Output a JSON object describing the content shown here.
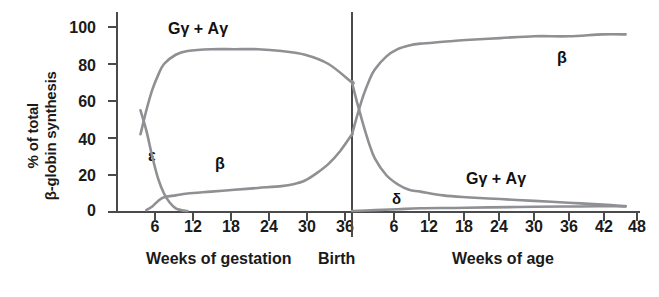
{
  "chart_data": {
    "type": "line",
    "title": "",
    "ylabel": "% of total\nβ-globin synthesis",
    "ylim": [
      0,
      100
    ],
    "yticks": [
      0,
      20,
      40,
      60,
      80,
      100
    ],
    "grid": false,
    "legend_position": "inline-annotations",
    "panels": [
      {
        "name": "gestation",
        "xlabel": "Weeks of gestation",
        "xticks": [
          6,
          12,
          18,
          24,
          30,
          36
        ],
        "xlim": [
          0,
          40
        ]
      },
      {
        "name": "postnatal",
        "xlabel": "Weeks of age",
        "xticks": [
          6,
          12,
          18,
          24,
          30,
          36,
          42,
          48
        ],
        "xlim": [
          0,
          50
        ]
      }
    ],
    "divider_label": "Birth",
    "annotations": [
      {
        "text": "Gγ + Aγ",
        "series": "gamma",
        "panel": "gestation",
        "position": "top-left"
      },
      {
        "text": "ε",
        "series": "epsilon",
        "panel": "gestation",
        "position": "left"
      },
      {
        "text": "β",
        "series": "beta",
        "panel": "gestation",
        "position": "mid-low"
      },
      {
        "text": "β",
        "series": "beta",
        "panel": "postnatal",
        "position": "top-right"
      },
      {
        "text": "Gγ + Aγ",
        "series": "gamma",
        "panel": "postnatal",
        "position": "bottom-right"
      },
      {
        "text": "δ",
        "series": "delta",
        "panel": "postnatal",
        "position": "bottom-left"
      }
    ],
    "series": [
      {
        "name": "Gγ + Aγ",
        "key": "gamma",
        "color": "#8f9094",
        "points_gestation": [
          [
            4,
            42
          ],
          [
            5,
            55
          ],
          [
            6,
            66
          ],
          [
            7,
            74
          ],
          [
            8,
            80
          ],
          [
            10,
            85
          ],
          [
            12,
            87
          ],
          [
            16,
            88
          ],
          [
            20,
            88
          ],
          [
            24,
            88
          ],
          [
            28,
            87
          ],
          [
            32,
            85
          ],
          [
            36,
            80
          ],
          [
            40,
            70
          ]
        ],
        "points_postnatal": [
          [
            0,
            70
          ],
          [
            1,
            58
          ],
          [
            2,
            47
          ],
          [
            3,
            37
          ],
          [
            4,
            29
          ],
          [
            6,
            20
          ],
          [
            8,
            15
          ],
          [
            10,
            12
          ],
          [
            12,
            11
          ],
          [
            16,
            9
          ],
          [
            20,
            8
          ],
          [
            26,
            7
          ],
          [
            32,
            6
          ],
          [
            38,
            5
          ],
          [
            44,
            4
          ],
          [
            48,
            3
          ]
        ]
      },
      {
        "name": "ε",
        "key": "epsilon",
        "color": "#8f9094",
        "points_gestation": [
          [
            4,
            55
          ],
          [
            5,
            44
          ],
          [
            6,
            30
          ],
          [
            7,
            18
          ],
          [
            8,
            10
          ],
          [
            9,
            5
          ],
          [
            10,
            2
          ],
          [
            11,
            1
          ],
          [
            12,
            0.5
          ]
        ],
        "points_postnatal": []
      },
      {
        "name": "β",
        "key": "beta",
        "color": "#8f9094",
        "points_gestation": [
          [
            5,
            1
          ],
          [
            6,
            3
          ],
          [
            7,
            6
          ],
          [
            8,
            8
          ],
          [
            10,
            9
          ],
          [
            12,
            10
          ],
          [
            16,
            11
          ],
          [
            20,
            12
          ],
          [
            24,
            13
          ],
          [
            28,
            14
          ],
          [
            30,
            15
          ],
          [
            32,
            17
          ],
          [
            34,
            21
          ],
          [
            36,
            26
          ],
          [
            38,
            33
          ],
          [
            40,
            42
          ]
        ],
        "points_postnatal": [
          [
            0,
            42
          ],
          [
            1,
            53
          ],
          [
            2,
            63
          ],
          [
            3,
            71
          ],
          [
            4,
            77
          ],
          [
            6,
            84
          ],
          [
            8,
            88
          ],
          [
            10,
            90
          ],
          [
            12,
            91
          ],
          [
            16,
            92
          ],
          [
            20,
            93
          ],
          [
            26,
            94
          ],
          [
            32,
            95
          ],
          [
            38,
            95
          ],
          [
            44,
            96
          ],
          [
            48,
            96
          ]
        ]
      },
      {
        "name": "δ",
        "key": "delta",
        "color": "#8f9094",
        "points_gestation": [],
        "points_postnatal": [
          [
            0,
            0.5
          ],
          [
            4,
            1
          ],
          [
            8,
            1.5
          ],
          [
            12,
            2
          ],
          [
            18,
            2.2
          ],
          [
            24,
            2.5
          ],
          [
            32,
            2.8
          ],
          [
            40,
            3
          ],
          [
            48,
            3.2
          ]
        ]
      }
    ]
  },
  "axis": {
    "y_title_line1": "% of total",
    "y_title_line2": "β-globin synthesis",
    "ytick_100": "100",
    "ytick_80": "80",
    "ytick_60": "60",
    "ytick_40": "40",
    "ytick_20": "20",
    "ytick_0": "0",
    "left_xticks": [
      "6",
      "12",
      "18",
      "24",
      "30",
      "36"
    ],
    "right_xticks": [
      "6",
      "12",
      "18",
      "24",
      "30",
      "36",
      "42",
      "48"
    ],
    "left_title": "Weeks of gestation",
    "birth_label": "Birth",
    "right_title": "Weeks of age"
  },
  "labels": {
    "gamma_top": "Gγ + Aγ",
    "epsilon": "ε",
    "beta_left": "β",
    "beta_right": "β",
    "gamma_bottom": "Gγ + Aγ",
    "delta": "δ"
  },
  "colors": {
    "curve": "#8f9094",
    "axis": "#4a4a4a",
    "text": "#1a1a1a",
    "background": "#ffffff"
  }
}
